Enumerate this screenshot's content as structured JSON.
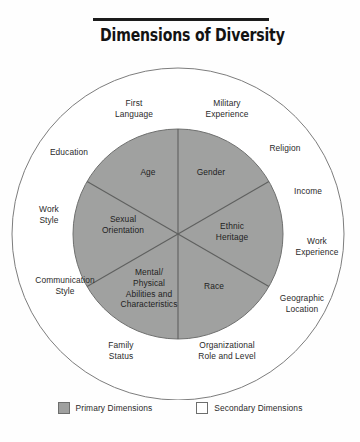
{
  "title": {
    "text": "Dimensions of Diversity"
  },
  "diagram": {
    "type": "concentric-wheel",
    "center": {
      "x": 178,
      "y": 234
    },
    "outer_circle": {
      "radius": 166,
      "fill": "#ffffff",
      "stroke": "#7d7d7d"
    },
    "inner_circle": {
      "radius": 105,
      "fill": "#a0a1a0",
      "stroke": "#6f706f"
    },
    "primary_color": "#a0a1a0",
    "secondary_color": "#ffffff",
    "primary_dimensions": [
      {
        "label": "Age",
        "position": "top-left-wedge"
      },
      {
        "label": "Gender",
        "position": "top-right-wedge"
      },
      {
        "label": "Ethnic\nHeritage",
        "position": "right-wedge"
      },
      {
        "label": "Race",
        "position": "bottom-right-wedge"
      },
      {
        "label": "Mental/\nPhysical\nAbilities and\nCharacteristics",
        "position": "bottom-left-wedge"
      },
      {
        "label": "Sexual\nOrientation",
        "position": "left-wedge"
      }
    ],
    "secondary_dimensions": [
      {
        "label": "First\nLanguage",
        "position": "top-left"
      },
      {
        "label": "Military\nExperience",
        "position": "top-right"
      },
      {
        "label": "Religion",
        "position": "upper-right"
      },
      {
        "label": "Income",
        "position": "right-upper"
      },
      {
        "label": "Work\nExperience",
        "position": "right"
      },
      {
        "label": "Geographic\nLocation",
        "position": "right-lower"
      },
      {
        "label": "Organizational\nRole and Level",
        "position": "bottom-right"
      },
      {
        "label": "Family\nStatus",
        "position": "bottom-left"
      },
      {
        "label": "Communication\nStyle",
        "position": "left-lower"
      },
      {
        "label": "Work\nStyle",
        "position": "left"
      },
      {
        "label": "Education",
        "position": "upper-left"
      }
    ]
  },
  "legend": {
    "primary_label": "Primary Dimensions",
    "secondary_label": "Secondary Dimensions"
  }
}
